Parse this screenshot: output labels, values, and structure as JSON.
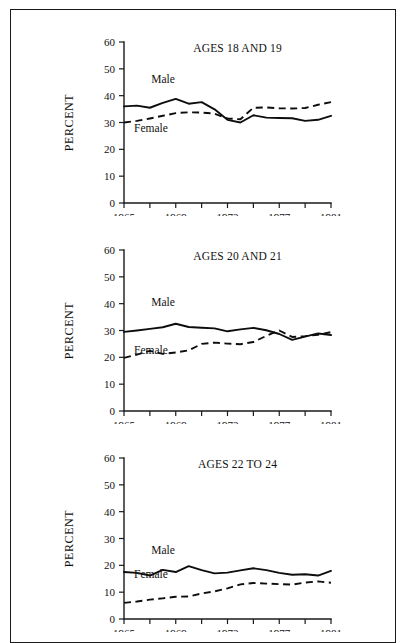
{
  "figure": {
    "background_color": "#ffffff",
    "border_color": "#1a1a1a",
    "line_color": "#0d0d0d"
  },
  "chart_data": [
    {
      "type": "line",
      "title": "AGES 18 AND 19",
      "xlabel": "",
      "ylabel": "PERCENT",
      "xlim": [
        1965,
        1981
      ],
      "ylim": [
        0,
        60
      ],
      "yticks": [
        0,
        10,
        20,
        30,
        40,
        50,
        60
      ],
      "ytick_labels": [
        "0",
        "10",
        "20",
        "30",
        "40",
        "50",
        "60"
      ],
      "xticks": [
        1965,
        1967,
        1969,
        1971,
        1973,
        1975,
        1977,
        1979,
        1981
      ],
      "xtick_labels": [
        "1965",
        "",
        "1969",
        "",
        "1973",
        "",
        "1977",
        "",
        "1981"
      ],
      "grid": false,
      "legend_position": "inline-annotations",
      "x": [
        1965,
        1966,
        1967,
        1968,
        1969,
        1970,
        1971,
        1972,
        1973,
        1974,
        1975,
        1976,
        1977,
        1978,
        1979,
        1980,
        1981
      ],
      "series": [
        {
          "name": "Male",
          "style": "solid",
          "label_text": "Male",
          "values": [
            36.0,
            36.3,
            35.5,
            37.3,
            38.8,
            37.0,
            37.6,
            34.9,
            31.0,
            30.0,
            32.7,
            31.8,
            31.7,
            31.6,
            30.6,
            31.0,
            32.5
          ]
        },
        {
          "name": "Female",
          "style": "dashed",
          "label_text": "Female",
          "values": [
            30.0,
            30.6,
            31.5,
            32.5,
            33.5,
            33.8,
            33.7,
            33.3,
            31.5,
            31.2,
            35.5,
            35.6,
            35.3,
            35.2,
            35.4,
            36.6,
            37.6
          ]
        }
      ]
    },
    {
      "type": "line",
      "title": "AGES 20 AND 21",
      "xlabel": "",
      "ylabel": "PERCENT",
      "xlim": [
        1965,
        1981
      ],
      "ylim": [
        0,
        60
      ],
      "yticks": [
        0,
        10,
        20,
        30,
        40,
        50,
        60
      ],
      "ytick_labels": [
        "0",
        "10",
        "20",
        "30",
        "40",
        "50",
        "60"
      ],
      "xticks": [
        1965,
        1967,
        1969,
        1971,
        1973,
        1975,
        1977,
        1979,
        1981
      ],
      "xtick_labels": [
        "1965",
        "",
        "1969",
        "",
        "1973",
        "",
        "1977",
        "",
        "1981"
      ],
      "grid": false,
      "legend_position": "inline-annotations",
      "x": [
        1965,
        1966,
        1967,
        1968,
        1969,
        1970,
        1971,
        1972,
        1973,
        1974,
        1975,
        1976,
        1977,
        1978,
        1979,
        1980,
        1981
      ],
      "series": [
        {
          "name": "Male",
          "style": "solid",
          "label_text": "Male",
          "values": [
            29.5,
            30.0,
            30.6,
            31.2,
            32.5,
            31.3,
            31.0,
            30.8,
            29.7,
            30.4,
            31.0,
            30.1,
            28.7,
            26.5,
            27.7,
            28.9,
            28.3
          ]
        },
        {
          "name": "Female",
          "style": "dashed",
          "label_text": "Female",
          "values": [
            19.8,
            21.0,
            22.4,
            21.3,
            21.8,
            22.6,
            25.0,
            25.5,
            25.1,
            24.9,
            25.7,
            28.0,
            30.0,
            27.6,
            27.9,
            28.4,
            29.4
          ]
        }
      ]
    },
    {
      "type": "line",
      "title": "AGES 22 TO 24",
      "xlabel": "",
      "ylabel": "PERCENT",
      "xlim": [
        1965,
        1981
      ],
      "ylim": [
        0,
        60
      ],
      "yticks": [
        0,
        10,
        20,
        30,
        40,
        50,
        60
      ],
      "ytick_labels": [
        "0",
        "10",
        "20",
        "30",
        "40",
        "50",
        "60"
      ],
      "xticks": [
        1965,
        1967,
        1969,
        1971,
        1973,
        1975,
        1977,
        1979,
        1981
      ],
      "xtick_labels": [
        "1965",
        "",
        "1969",
        "",
        "1973",
        "",
        "1977",
        "",
        "1981"
      ],
      "grid": false,
      "legend_position": "inline-annotations",
      "x": [
        1965,
        1966,
        1967,
        1968,
        1969,
        1970,
        1971,
        1972,
        1973,
        1974,
        1975,
        1976,
        1977,
        1978,
        1979,
        1980,
        1981
      ],
      "series": [
        {
          "name": "Male",
          "style": "solid",
          "label_text": "Male",
          "values": [
            17.5,
            17.2,
            16.2,
            18.3,
            17.5,
            19.7,
            18.2,
            17.0,
            17.3,
            18.1,
            18.9,
            18.2,
            17.2,
            16.5,
            16.7,
            16.2,
            17.9
          ]
        },
        {
          "name": "Female",
          "style": "dashed",
          "label_text": "Female",
          "values": [
            6.0,
            6.5,
            7.2,
            7.7,
            8.3,
            8.4,
            9.5,
            10.3,
            11.4,
            12.9,
            13.4,
            13.2,
            13.0,
            12.8,
            13.6,
            14.0,
            13.5
          ]
        }
      ]
    }
  ]
}
